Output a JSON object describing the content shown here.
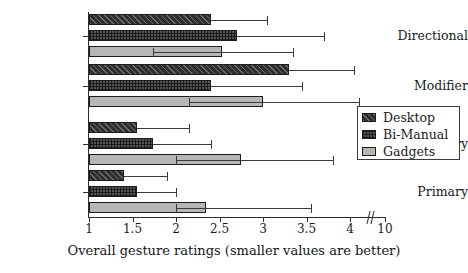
{
  "chart_data": {
    "type": "bar",
    "orientation": "horizontal",
    "title": "",
    "xlabel": "Overall gesture ratings (smaller values are better)",
    "ylabel": "",
    "categories": [
      "Directional",
      "Modifier",
      "Secondary",
      "Primary"
    ],
    "series": [
      {
        "name": "Desktop",
        "color": "#2e2e2e",
        "pattern": "diagonal-hatch",
        "values": [
          2.4,
          3.3,
          1.55,
          1.4
        ],
        "err_high": [
          3.05,
          4.05,
          2.15,
          1.9
        ]
      },
      {
        "name": "Bi-Manual",
        "color": "#545454",
        "pattern": "cross-hatch",
        "values": [
          2.7,
          2.4,
          1.73,
          1.55
        ],
        "err_high": [
          3.7,
          3.45,
          2.4,
          2.0
        ]
      },
      {
        "name": "Gadgets",
        "color": "#b6b6b6",
        "pattern": "solid-light",
        "values": [
          2.53,
          3.0,
          2.75,
          2.35
        ],
        "err_low": [
          1.73,
          2.15,
          2.0,
          2.0
        ],
        "err_high": [
          3.35,
          4.1,
          3.8,
          3.55
        ]
      }
    ],
    "xticks": [
      {
        "label": "1",
        "value": 1
      },
      {
        "label": "1.5",
        "value": 1.5
      },
      {
        "label": "2",
        "value": 2
      },
      {
        "label": "2.5",
        "value": 2.5
      },
      {
        "label": "3",
        "value": 3
      },
      {
        "label": "3.5",
        "value": 3.5
      },
      {
        "label": "4",
        "value": 4
      },
      {
        "label": "10",
        "value": 10
      }
    ],
    "axis_break": true,
    "xlim": [
      1,
      10
    ],
    "grid": false,
    "legend_position": "right",
    "legend_entries": [
      "Desktop",
      "Bi-Manual",
      "Gadgets"
    ]
  },
  "legend": {
    "items": [
      {
        "label": "Desktop"
      },
      {
        "label": "Bi-Manual"
      },
      {
        "label": "Gadgets"
      }
    ]
  },
  "axis": {
    "x_title": "Overall gesture ratings (smaller values are better)"
  }
}
